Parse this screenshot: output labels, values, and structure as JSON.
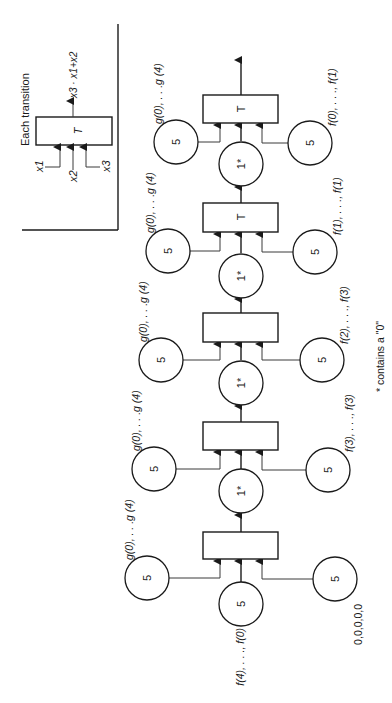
{
  "diagram": {
    "orientation": "rotated-90-ccw",
    "colors": {
      "ink": "#1a1a1a",
      "background": "#ffffff"
    },
    "legend": {
      "title": "Each transition",
      "box_label": "T",
      "inputs": [
        "x1",
        "x2",
        "x3"
      ],
      "output_label": "x3 · x1+x2"
    },
    "transitions": [
      {
        "id": "t1",
        "label": ""
      },
      {
        "id": "t2",
        "label": ""
      },
      {
        "id": "t3",
        "label": ""
      },
      {
        "id": "t4",
        "label": "T"
      },
      {
        "id": "t5",
        "label": "T"
      }
    ],
    "star_places": [
      {
        "label": "1*"
      },
      {
        "label": "1*"
      },
      {
        "label": "1*"
      },
      {
        "label": "1*"
      }
    ],
    "left_places": [
      {
        "label": "5",
        "annotation": "g(0), . . .g (4)"
      },
      {
        "label": "5",
        "annotation": "g(0), . . .g (4)"
      },
      {
        "label": "5",
        "annotation": "g(0), . . .g (4)"
      },
      {
        "label": "5",
        "annotation": "g(0), . . .g (4)"
      },
      {
        "label": "5",
        "annotation": "g(0), . . .g (4)"
      }
    ],
    "right_places": [
      {
        "label": "5",
        "annotation": "0,0,0,0,0"
      },
      {
        "label": "5",
        "annotation": "f(3), . . ., f(3)"
      },
      {
        "label": "5",
        "annotation": "f(2), . . ., f(3)"
      },
      {
        "label": "5",
        "annotation": "f(1), . . ., f(1)"
      },
      {
        "label": "5",
        "annotation": "f(0), . . ., f(1)"
      }
    ],
    "initial_place": {
      "label": "5",
      "annotation": "f(4), . . ., f(0)"
    },
    "footnote": "* contains a \"0\""
  }
}
